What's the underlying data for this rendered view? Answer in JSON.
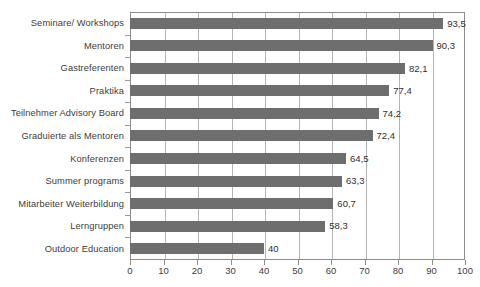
{
  "chart_data": {
    "type": "bar",
    "orientation": "horizontal",
    "title": "",
    "xlabel": "",
    "ylabel": "",
    "xlim": [
      0,
      100
    ],
    "xticks": [
      "0",
      "10",
      "20",
      "30",
      "40",
      "50",
      "60",
      "70",
      "80",
      "90",
      "100"
    ],
    "grid": "vertical",
    "legend": "none",
    "bar_color": "#6e6e6e",
    "categories": [
      "Seminare/ Workshops",
      "Mentoren",
      "Gastreferenten",
      "Praktika",
      "Teilnehmer Advisory Board",
      "Graduierte als Mentoren",
      "Konferenzen",
      "Summer programs",
      "Mitarbeiter Weiterbildung",
      "Lerngruppen",
      "Outdoor Education"
    ],
    "values": [
      93.5,
      90.3,
      82.1,
      77.4,
      74.2,
      72.4,
      64.5,
      63.3,
      60.7,
      58.3,
      40
    ],
    "value_labels": [
      "93,5",
      "90,3",
      "82,1",
      "77,4",
      "74,2",
      "72,4",
      "64,5",
      "63,3",
      "60,7",
      "58,3",
      "40"
    ]
  }
}
